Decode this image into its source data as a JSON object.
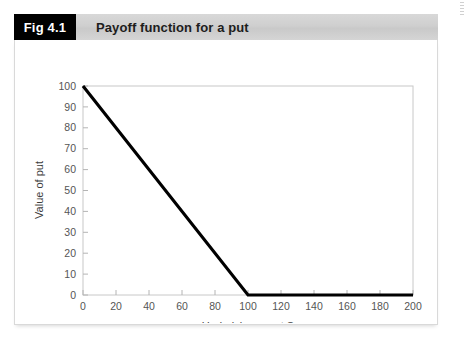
{
  "figure": {
    "badge_label": "Fig 4.1",
    "title": "Payoff function for a put"
  },
  "colors": {
    "badge_bg": "#000000",
    "badge_text": "#ffffff",
    "header_bar": "#cfcfcf",
    "line": "#000000",
    "frame": "#c8c8c8",
    "tick_label": "#555555",
    "axis_title": "#3d3d3d",
    "card_bg": "#ffffff"
  },
  "chart_data": {
    "type": "line",
    "title": "Payoff function for a put",
    "xlabel": "Underlying asset S",
    "ylabel": "Value of put",
    "xlim": [
      0,
      200
    ],
    "ylim": [
      0,
      100
    ],
    "xticks": [
      0,
      20,
      40,
      60,
      80,
      100,
      120,
      140,
      160,
      180,
      200
    ],
    "yticks": [
      0,
      10,
      20,
      30,
      40,
      50,
      60,
      70,
      80,
      90,
      100
    ],
    "xtick_labels": [
      "0",
      "20",
      "40",
      "60",
      "80",
      "100",
      "120",
      "140",
      "160",
      "180",
      "200"
    ],
    "ytick_labels": [
      "0",
      "10",
      "20",
      "30",
      "40",
      "50",
      "60",
      "70",
      "80",
      "90",
      "100"
    ],
    "grid": false,
    "legend": null,
    "series": [
      {
        "name": "Put payoff",
        "color": "#000000",
        "linewidth": 3,
        "x": [
          0,
          100,
          200
        ],
        "y": [
          100,
          0,
          0
        ]
      }
    ],
    "annotations": [],
    "strike": 100
  }
}
